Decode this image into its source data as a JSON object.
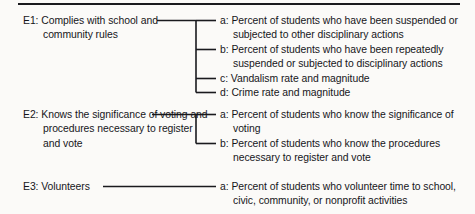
{
  "figure": {
    "type": "bracket-diagram",
    "has_top_rule": true,
    "ink_color": "#1a1a1e",
    "background_color": "#fbfaf8"
  },
  "groups": [
    {
      "id": "E1",
      "label": "E1: Complies with school and community rules",
      "items": [
        "a: Percent of students who have been suspended or subjected to other disciplinary actions",
        "b: Percent of students who have been repeatedly suspended or subjected to disciplinary actions",
        "c: Vandalism rate and magnitude",
        "d: Crime rate and magnitude"
      ]
    },
    {
      "id": "E2",
      "label": "E2: Knows the significance of voting and procedures necessary to register and vote",
      "items": [
        "a: Percent of students who know the significance of voting",
        "b: Percent of students who know the procedures necessary to register and vote"
      ]
    },
    {
      "id": "E3",
      "label": "E3: Volunteers",
      "items": [
        "a: Percent of students who volunteer time to school, civic, community, or nonprofit activities"
      ]
    }
  ]
}
